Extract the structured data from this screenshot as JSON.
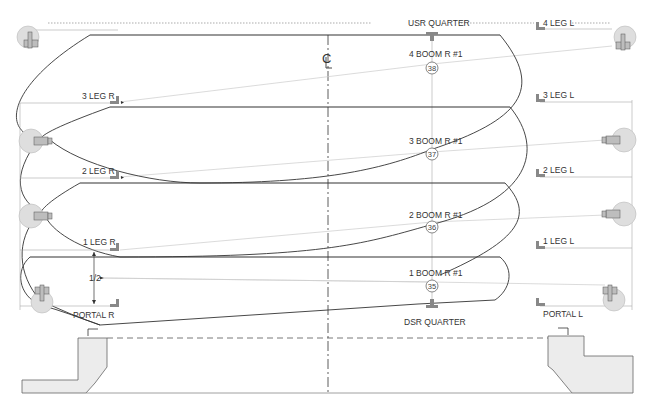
{
  "diagram": {
    "type": "lighting-plot-section",
    "centerline_label": "CL",
    "top_labels": {
      "usr": "USR QUARTER",
      "dsr": "DSR QUARTER"
    },
    "booms": [
      {
        "label": "4 BOOM R #1",
        "unit": "38"
      },
      {
        "label": "3 BOOM R #1",
        "unit": "37"
      },
      {
        "label": "2 BOOM R #1",
        "unit": "36"
      },
      {
        "label": "1 BOOM R #1",
        "unit": "35"
      }
    ],
    "legs_right": [
      {
        "label": "3 LEG R"
      },
      {
        "label": "2 LEG R"
      },
      {
        "label": "1 LEG R"
      },
      {
        "label": "PORTAL  R"
      }
    ],
    "legs_left": [
      {
        "label": "4 LEG L"
      },
      {
        "label": "3 LEG L"
      },
      {
        "label": "2 LEG L"
      },
      {
        "label": "1 LEG L"
      },
      {
        "label": "PORTAL  L"
      }
    ],
    "dimension": {
      "label": "1/2"
    }
  }
}
